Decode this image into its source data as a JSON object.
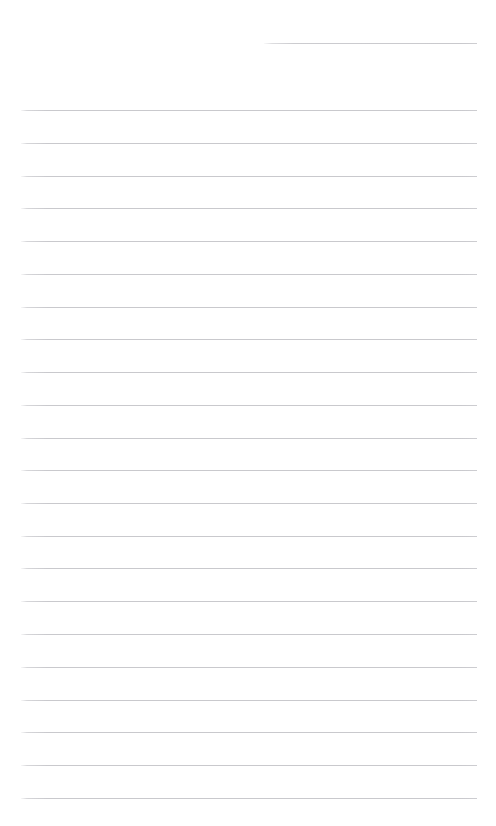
{
  "document": {
    "kind": "ruled-notepaper",
    "title": "",
    "page_width": 496,
    "page_height": 826,
    "background_color": "#ffffff",
    "rule_color": "#c9c9cd",
    "rule_thickness_px": 1,
    "rule_spacing_px": 32.85,
    "content_text": "",
    "has_handwriting": false,
    "has_header_text": false,
    "has_page_number": false
  },
  "rules": {
    "short_rule": {
      "name": "header-rule",
      "x": 264,
      "y": 43,
      "width": 213,
      "label": ""
    },
    "body_left_x": 21,
    "body_right_x": 477,
    "body_width": 456,
    "lines": [
      {
        "index": 1,
        "y": 110,
        "text": ""
      },
      {
        "index": 2,
        "y": 143,
        "text": ""
      },
      {
        "index": 3,
        "y": 176,
        "text": ""
      },
      {
        "index": 4,
        "y": 208,
        "text": ""
      },
      {
        "index": 5,
        "y": 241,
        "text": ""
      },
      {
        "index": 6,
        "y": 274,
        "text": ""
      },
      {
        "index": 7,
        "y": 307,
        "text": ""
      },
      {
        "index": 8,
        "y": 339,
        "text": ""
      },
      {
        "index": 9,
        "y": 372,
        "text": ""
      },
      {
        "index": 10,
        "y": 405,
        "text": ""
      },
      {
        "index": 11,
        "y": 438,
        "text": ""
      },
      {
        "index": 12,
        "y": 470,
        "text": ""
      },
      {
        "index": 13,
        "y": 503,
        "text": ""
      },
      {
        "index": 14,
        "y": 536,
        "text": ""
      },
      {
        "index": 15,
        "y": 568,
        "text": ""
      },
      {
        "index": 16,
        "y": 601,
        "text": ""
      },
      {
        "index": 17,
        "y": 634,
        "text": ""
      },
      {
        "index": 18,
        "y": 667,
        "text": ""
      },
      {
        "index": 19,
        "y": 700,
        "text": ""
      },
      {
        "index": 20,
        "y": 732,
        "text": ""
      },
      {
        "index": 21,
        "y": 765,
        "text": ""
      },
      {
        "index": 22,
        "y": 798,
        "text": ""
      }
    ]
  }
}
